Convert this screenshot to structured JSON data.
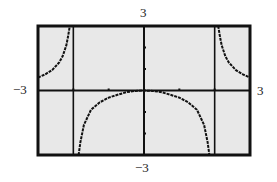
{
  "window": {
    "xmin_label": "−3",
    "xmax_label": "3",
    "ymax_label": "3",
    "ymin_label": "−3"
  },
  "colors": {
    "screen_bg": "#e8e8e8",
    "frame": "#111111",
    "curve": "#111111",
    "page_bg": "#ffffff"
  },
  "chart_data": {
    "type": "line",
    "title": "",
    "xlabel": "",
    "ylabel": "",
    "xlim": [
      -3,
      3
    ],
    "ylim": [
      -3,
      3
    ],
    "x_ticks": [
      -2,
      -1,
      0,
      1,
      2
    ],
    "y_ticks": [
      -3,
      -2,
      -1,
      1,
      2,
      3
    ],
    "grid": false,
    "vertical_asymptotes": [
      -2,
      2
    ],
    "series": [
      {
        "name": "left branch (x < -2)",
        "x": [
          -3.0,
          -2.8,
          -2.6,
          -2.4,
          -2.3,
          -2.2,
          -2.15,
          -2.1
        ],
        "y": [
          0.6,
          0.75,
          0.95,
          1.3,
          1.6,
          2.1,
          2.5,
          3.0
        ]
      },
      {
        "name": "middle branch (-2 < x < 2)",
        "x": [
          -1.85,
          -1.8,
          -1.7,
          -1.5,
          -1.25,
          -1.0,
          -0.75,
          -0.5,
          -0.25,
          0.0,
          0.25,
          0.5,
          0.75,
          1.0,
          1.25,
          1.5,
          1.7,
          1.8,
          1.85
        ],
        "y": [
          -3.0,
          -2.4,
          -1.6,
          -0.9,
          -0.55,
          -0.33,
          -0.2,
          -0.08,
          -0.02,
          0.0,
          -0.02,
          -0.08,
          -0.2,
          -0.33,
          -0.55,
          -0.9,
          -1.6,
          -2.4,
          -3.0
        ]
      },
      {
        "name": "right branch (x > 2)",
        "x": [
          2.1,
          2.15,
          2.2,
          2.3,
          2.4,
          2.6,
          2.8,
          3.0
        ],
        "y": [
          3.0,
          2.5,
          2.1,
          1.6,
          1.3,
          0.95,
          0.75,
          0.6
        ]
      }
    ]
  }
}
